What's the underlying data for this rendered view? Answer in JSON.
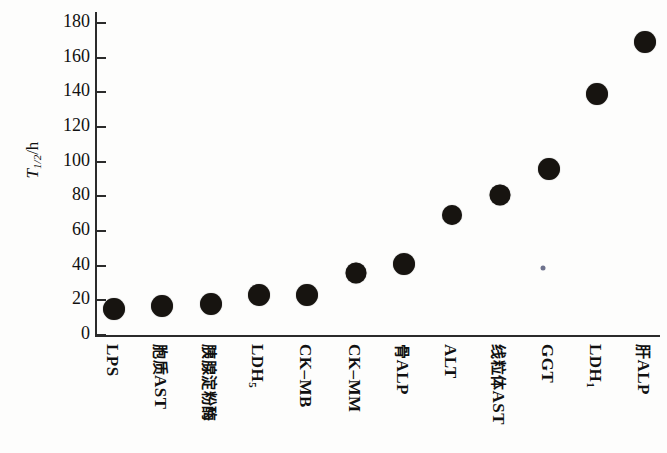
{
  "chart_data": {
    "type": "scatter",
    "title": "",
    "subtitle": "",
    "xlabel": "",
    "ylabel": "T1/2/h",
    "ylabel_parts": {
      "symbol": "T",
      "subscript": "1/2",
      "unit": "/h"
    },
    "ylim": [
      0,
      180
    ],
    "ytick_values": [
      0,
      20,
      40,
      60,
      80,
      100,
      120,
      140,
      160,
      180
    ],
    "ytick_labels": [
      "0",
      "20",
      "40",
      "60",
      "80",
      "100",
      "120",
      "140",
      "160",
      "180"
    ],
    "grid": false,
    "legend": "none",
    "categories": [
      "LPS",
      "胞质AST",
      "胰腺淀粉酶",
      "LDH5",
      "CK–MB",
      "CK–MM",
      "骨ALP",
      "ALT",
      "线粒体AST",
      "GGT",
      "LDH1",
      "肝ALP"
    ],
    "category_labels_html": [
      {
        "text": "LPS",
        "sub": "",
        "cjk": ""
      },
      {
        "text": "AST",
        "sub": "",
        "cjk": "胞质"
      },
      {
        "text": "",
        "sub": "",
        "cjk": "胰腺淀粉酶"
      },
      {
        "text": "LDH",
        "sub": "5",
        "cjk": ""
      },
      {
        "text": "CK–MB",
        "sub": "",
        "cjk": ""
      },
      {
        "text": "CK–MM",
        "sub": "",
        "cjk": ""
      },
      {
        "text": "ALP",
        "sub": "",
        "cjk": "骨"
      },
      {
        "text": "ALT",
        "sub": "",
        "cjk": ""
      },
      {
        "text": "AST",
        "sub": "",
        "cjk": "线粒体"
      },
      {
        "text": "GGT",
        "sub": "",
        "cjk": ""
      },
      {
        "text": "LDH",
        "sub": "1",
        "cjk": ""
      },
      {
        "text": "ALP",
        "sub": "",
        "cjk": "肝"
      }
    ],
    "values": [
      15,
      17,
      18,
      23,
      23,
      36,
      41,
      69,
      81,
      96,
      139,
      169
    ],
    "marker": {
      "shape": "circle",
      "color": "#171410",
      "sizes_px": [
        22,
        22,
        22,
        22,
        22,
        21,
        22,
        20,
        21,
        22,
        22,
        22
      ]
    },
    "axis_color": "#2b2b2b",
    "background_color": "#fdfdfc"
  }
}
